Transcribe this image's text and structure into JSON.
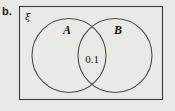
{
  "figure": {
    "part_label": "b.",
    "type": "venn-diagram",
    "universal_set_symbol": "ξ",
    "background_color": "#e9e9e5",
    "stroke_color": "#3a3a3a",
    "text_color": "#141414",
    "sets": [
      {
        "name": "A",
        "label": "A",
        "position": "left"
      },
      {
        "name": "B",
        "label": "B",
        "position": "right"
      }
    ],
    "regions": [
      {
        "name": "A-only",
        "label": "",
        "value": ""
      },
      {
        "name": "A-intersect-B",
        "label": "0.1",
        "value": "0.1"
      },
      {
        "name": "B-only",
        "label": "",
        "value": ""
      },
      {
        "name": "outside",
        "label": "",
        "value": ""
      }
    ],
    "intersection_value": "0.1"
  }
}
